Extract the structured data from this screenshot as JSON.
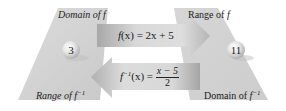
{
  "diagram": {
    "left_set": {
      "top_label_prefix": "Domain of ",
      "top_label_fn": "f",
      "bottom_label_prefix": "Range of ",
      "bottom_label_fn": "f",
      "bottom_label_sup": "−1",
      "element": "3"
    },
    "right_set": {
      "top_label_prefix": "Range of ",
      "top_label_fn": "f",
      "bottom_label_prefix": "Domain of ",
      "bottom_label_fn": "f",
      "bottom_label_sup": "−1",
      "element": "11"
    },
    "forward_arrow": {
      "fn_name": "f",
      "arg": "(x)",
      "rhs": " = 2x + 5",
      "direction": "right"
    },
    "inverse_arrow": {
      "fn_name": "f",
      "fn_sup": "−1",
      "arg": "(x) = ",
      "numerator": "x − 5",
      "denominator": "2",
      "direction": "left"
    },
    "colors": {
      "panel": "#d2d2d2",
      "arrow_light": "#d8d8d8",
      "arrow_dark": "#a9a9a9",
      "ball_light": "#f2f2f2",
      "ball_dark": "#b8b8b8"
    }
  }
}
